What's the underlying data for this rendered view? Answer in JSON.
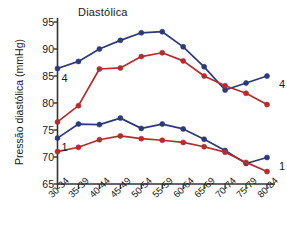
{
  "chart_data": {
    "type": "line",
    "title": "Diastólica",
    "xlabel": "",
    "ylabel": "Pressão diastólica (mmHg)",
    "ylim": [
      65,
      95
    ],
    "yticks": [
      65,
      70,
      75,
      80,
      85,
      90,
      95
    ],
    "grid": false,
    "legend_position": "inline-endpoints",
    "categories": [
      "30-34",
      "35-39",
      "40-44",
      "45-49",
      "50-54",
      "55-59",
      "60-64",
      "65-69",
      "70-74",
      "75-79",
      "80-84"
    ],
    "series": [
      {
        "name": "4",
        "color": "#2b3a7a",
        "marker": "circle",
        "start_label": "4",
        "end_label": "4",
        "values": [
          86.4,
          87.7,
          90.0,
          91.6,
          93.0,
          93.2,
          90.4,
          86.7,
          82.4,
          83.7,
          85.0
        ]
      },
      {
        "name": "4-red",
        "color": "#b62b2b",
        "marker": "circle",
        "start_label": "",
        "end_label": "",
        "values": [
          76.5,
          79.5,
          86.3,
          86.5,
          88.6,
          89.3,
          87.8,
          85.0,
          83.2,
          81.8,
          79.7
        ]
      },
      {
        "name": "1",
        "color": "#2b3a7a",
        "marker": "circle",
        "start_label": "1",
        "end_label": "1",
        "values": [
          73.5,
          76.1,
          76.0,
          77.2,
          75.3,
          76.1,
          75.2,
          73.3,
          71.2,
          68.8,
          69.9
        ]
      },
      {
        "name": "1-red",
        "color": "#b62b2b",
        "marker": "circle",
        "start_label": "",
        "end_label": "",
        "values": [
          71.0,
          71.8,
          73.2,
          73.9,
          73.4,
          73.1,
          72.7,
          71.9,
          70.9,
          69.0,
          67.3
        ]
      }
    ],
    "annotations": [
      {
        "text": "4",
        "position": "left-upper"
      },
      {
        "text": "1",
        "position": "left-lower"
      },
      {
        "text": "4",
        "position": "right-upper"
      },
      {
        "text": "1",
        "position": "right-lower"
      }
    ],
    "colors": {
      "blue": "#2b3a7a",
      "red": "#b62b2b",
      "axis": "#333333",
      "text": "#1a1a1a",
      "background": "#ffffff"
    }
  }
}
